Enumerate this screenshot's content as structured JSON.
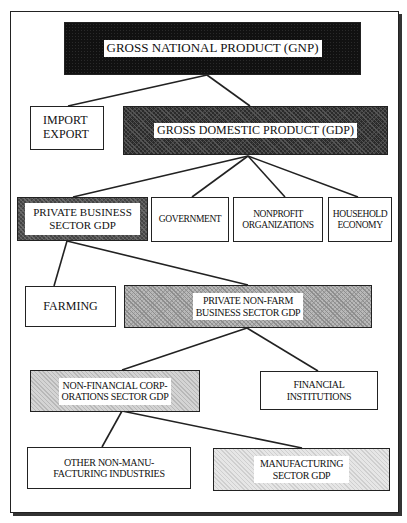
{
  "diagram": {
    "type": "hierarchy",
    "nodes": {
      "gnp": {
        "label": "GROSS NATIONAL PRODUCT (GNP)",
        "fill": "black"
      },
      "import_export": {
        "label": "IMPORT\nEXPORT",
        "fill": "white"
      },
      "gdp": {
        "label": "GROSS DOMESTIC PRODUCT (GDP)",
        "fill": "dark"
      },
      "private_business": {
        "label": "PRIVATE BUSINESS\nSECTOR GDP",
        "fill": "dark-border"
      },
      "government": {
        "label": "GOVERNMENT",
        "fill": "white"
      },
      "nonprofit": {
        "label": "NONPROFIT\nORGANIZATIONS",
        "fill": "white"
      },
      "household": {
        "label": "HOUSEHOLD\nECONOMY",
        "fill": "white"
      },
      "farming": {
        "label": "FARMING",
        "fill": "white"
      },
      "private_nonfarm": {
        "label": "PRIVATE NON-FARM\nBUSINESS SECTOR GDP",
        "fill": "medium"
      },
      "nonfinancial": {
        "label": "NON-FINANCIAL CORP-\nORATIONS SECTOR GDP",
        "fill": "light"
      },
      "financial": {
        "label": "FINANCIAL\nINSTITUTIONS",
        "fill": "white"
      },
      "other_nonmanufacturing": {
        "label": "OTHER NON-MANU-\nFACTURING INDUSTRIES",
        "fill": "white"
      },
      "manufacturing": {
        "label": "MANUFACTURING\nSECTOR GDP",
        "fill": "lighter"
      }
    },
    "edges": [
      [
        "gnp",
        "import_export"
      ],
      [
        "gnp",
        "gdp"
      ],
      [
        "gdp",
        "private_business"
      ],
      [
        "gdp",
        "government"
      ],
      [
        "gdp",
        "nonprofit"
      ],
      [
        "gdp",
        "household"
      ],
      [
        "private_business",
        "farming"
      ],
      [
        "private_business",
        "private_nonfarm"
      ],
      [
        "private_nonfarm",
        "nonfinancial"
      ],
      [
        "private_nonfarm",
        "financial"
      ],
      [
        "nonfinancial",
        "other_nonmanufacturing"
      ],
      [
        "nonfinancial",
        "manufacturing"
      ]
    ]
  }
}
